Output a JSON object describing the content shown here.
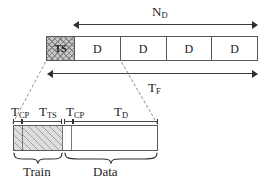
{
  "figure": {
    "title_visible": false,
    "colors": {
      "line": "#3c3c3c",
      "border": "#5a5a5a",
      "ts_fill": "#c9c9c9",
      "hatch_fill": "#dedede",
      "dashed": "#9a9a9a",
      "text": "#1a1a1a"
    }
  },
  "frame_bar": {
    "name": "ofdm-frame-structure",
    "cells": [
      {
        "label": "TS",
        "kind": "training-sequence",
        "shaded": true
      },
      {
        "label": "D",
        "kind": "data-symbol",
        "shaded": false
      },
      {
        "label": "D",
        "kind": "data-symbol",
        "shaded": false
      },
      {
        "label": "D",
        "kind": "data-symbol",
        "shaded": false
      },
      {
        "label": "D",
        "kind": "data-symbol",
        "shaded": false
      }
    ]
  },
  "annotations": {
    "nd": {
      "base": "N",
      "sub": "D"
    },
    "tf": {
      "base": "T",
      "sub": "F"
    },
    "tcp1": {
      "base": "T",
      "sub": "CP"
    },
    "tts": {
      "base": "T",
      "sub": "TS"
    },
    "tcp2": {
      "base": "T",
      "sub": "CP"
    },
    "td": {
      "base": "T",
      "sub": "D"
    }
  },
  "detail_bar": {
    "name": "symbol-timing-detail",
    "segments": [
      {
        "id": "cp-train",
        "label_ref": "tcp1",
        "hatched": true,
        "width_px": 9
      },
      {
        "id": "ts",
        "label_ref": "tts",
        "hatched": true,
        "width_px": 40
      },
      {
        "id": "cp-data",
        "label_ref": "tcp2",
        "hatched": false,
        "width_px": 9
      },
      {
        "id": "data",
        "label_ref": "td",
        "hatched": false,
        "width_px": 85
      }
    ]
  },
  "braces": [
    {
      "id": "train-brace",
      "label": "Train"
    },
    {
      "id": "data-brace",
      "label": "Data"
    }
  ]
}
